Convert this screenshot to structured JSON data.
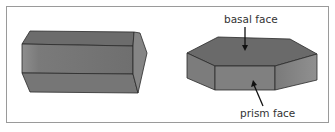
{
  "diagram": {
    "left_figure": {
      "description": "elongated hexagonal prism (columnar crystal)"
    },
    "right_figure": {
      "description": "flat hexagonal plate crystal",
      "labels": {
        "top": "basal face",
        "bottom": "prism face"
      }
    },
    "colors": {
      "face_top": "#6e6e6e",
      "face_front": "#7d7d7d",
      "face_side": "#8a8a8a",
      "edge": "#2a2a2a",
      "frame": "#9a9a9a"
    }
  }
}
